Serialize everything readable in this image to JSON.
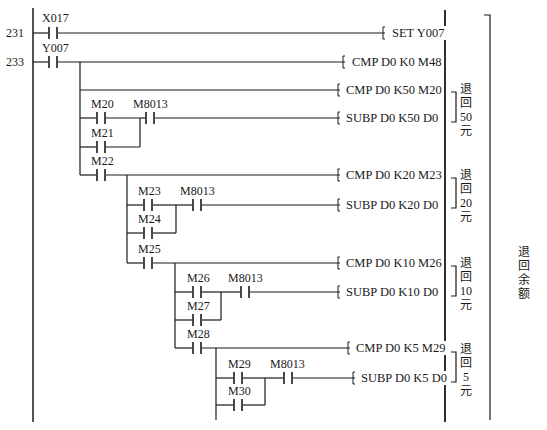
{
  "diagram": {
    "type": "plc-ladder-diagram",
    "step_numbers": [
      "231",
      "233"
    ],
    "rungs": [
      {
        "step": "231",
        "contacts": [
          "X017"
        ],
        "instruction": "SET  Y007"
      },
      {
        "step": "233",
        "contacts": [
          "Y007"
        ],
        "instruction": "CMP  D0  K0  M48"
      }
    ],
    "contacts": {
      "x017": "X017",
      "y007": "Y007",
      "m20": "M20",
      "m21": "M21",
      "m22": "M22",
      "m23": "M23",
      "m24": "M24",
      "m25": "M25",
      "m26": "M26",
      "m27": "M27",
      "m28": "M28",
      "m29": "M29",
      "m30": "M30",
      "m8013_a": "M8013",
      "m8013_b": "M8013",
      "m8013_c": "M8013",
      "m8013_d": "M8013"
    },
    "instructions": {
      "set_y007": "SET  Y007",
      "cmp_k0": "CMP  D0  K0  M48",
      "cmp_k50": "CMP  D0  K50 M20",
      "subp_k50": "SUBP  D0  K50  D0",
      "cmp_k20": "CMP  D0  K20 M23",
      "subp_k20": "SUBP  D0  K20  D0",
      "cmp_k10": "CMP  D0  K10 M26",
      "subp_k10": "SUBP  D0  K10  D0",
      "cmp_k5": "CMP  D0  K5  M29",
      "subp_k5": "SUBP  D0  K5  D0"
    },
    "annotations": {
      "return_50": "退回50元",
      "return_20": "退回20元",
      "return_10": "退回10元",
      "return_5": "退回5元",
      "return_balance": "退回余额"
    }
  }
}
